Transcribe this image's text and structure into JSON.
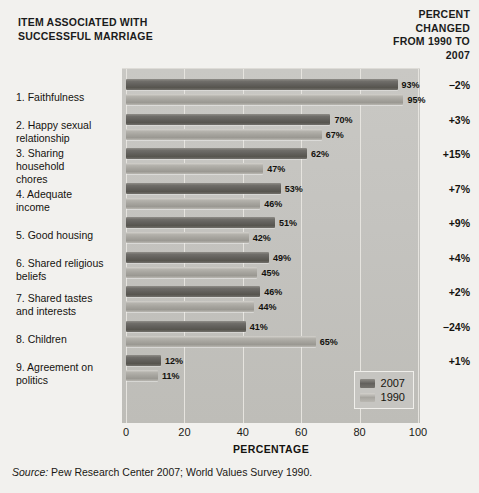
{
  "header": {
    "left_title": "ITEM ASSOCIATED WITH SUCCESSFUL MARRIAGE",
    "right_title": "PERCENT CHANGED FROM 1990 TO 2007"
  },
  "source": {
    "label": "Source:",
    "text": " Pew Research Center 2007; World Values Survey 1990."
  },
  "legend": {
    "items": [
      {
        "label": "2007",
        "key": "y2007"
      },
      {
        "label": "1990",
        "key": "y1990"
      }
    ]
  },
  "axis": {
    "title": "PERCENTAGE",
    "ticks": [
      "0",
      "20",
      "40",
      "60",
      "80",
      "100"
    ]
  },
  "chart_data": {
    "type": "bar",
    "orientation": "horizontal",
    "title": "ITEM ASSOCIATED WITH SUCCESSFUL MARRIAGE",
    "xlabel": "PERCENTAGE",
    "ylabel": "",
    "xlim": [
      0,
      100
    ],
    "grid": true,
    "legend_position": "bottom-right",
    "categories": [
      "1. Faithfulness",
      "2. Happy sexual relationship",
      "3. Sharing household chores",
      "4. Adequate income",
      "5. Good housing",
      "6. Shared religious beliefs",
      "7. Shared tastes and interests",
      "8. Children",
      "9. Agreement on politics"
    ],
    "category_labels_multiline": [
      "1. Faithfulness",
      "2. Happy sexual\n    relationship",
      "3. Sharing\n    household\n    chores",
      "4. Adequate\n    income",
      "5. Good housing",
      "6. Shared religious\n    beliefs",
      "7. Shared tastes\n    and interests",
      "8. Children",
      "9. Agreement on\n    politics"
    ],
    "series": [
      {
        "name": "2007",
        "values": [
          93,
          70,
          62,
          53,
          51,
          49,
          46,
          41,
          12
        ],
        "labels": [
          "93%",
          "70%",
          "62%",
          "53%",
          "51%",
          "49%",
          "46%",
          "41%",
          "12%"
        ]
      },
      {
        "name": "1990",
        "values": [
          95,
          67,
          47,
          46,
          42,
          45,
          44,
          65,
          11
        ],
        "labels": [
          "95%",
          "67%",
          "47%",
          "46%",
          "42%",
          "45%",
          "44%",
          "65%",
          "11%"
        ]
      }
    ],
    "percent_changed_1990_to_2007": [
      "−2%",
      "+3%",
      "+15%",
      "+7%",
      "+9%",
      "+4%",
      "+2%",
      "−24%",
      "+1%"
    ]
  }
}
